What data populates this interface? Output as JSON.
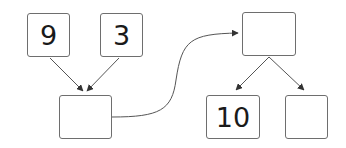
{
  "diagram": {
    "type": "number-bond-flow",
    "stroke_color": "#555555",
    "boxes": [
      {
        "id": "top-left-a",
        "value": "9",
        "x": 27,
        "y": 13,
        "w": 43,
        "h": 44
      },
      {
        "id": "top-left-b",
        "value": "3",
        "x": 100,
        "y": 13,
        "w": 43,
        "h": 44
      },
      {
        "id": "middle-left",
        "value": "",
        "x": 59,
        "y": 95,
        "w": 53,
        "h": 44
      },
      {
        "id": "top-right",
        "value": "",
        "x": 242,
        "y": 12,
        "w": 54,
        "h": 44
      },
      {
        "id": "bottom-right-a",
        "value": "10",
        "x": 206,
        "y": 95,
        "w": 54,
        "h": 44
      },
      {
        "id": "bottom-right-b",
        "value": "",
        "x": 285,
        "y": 95,
        "w": 43,
        "h": 44
      }
    ],
    "arrows": [
      {
        "from": "top-left-a",
        "to": "middle-left"
      },
      {
        "from": "top-left-b",
        "to": "middle-left"
      },
      {
        "from": "middle-left",
        "to": "top-right",
        "curved": true
      },
      {
        "from": "top-right",
        "to": "bottom-right-a"
      },
      {
        "from": "top-right",
        "to": "bottom-right-b"
      }
    ]
  }
}
